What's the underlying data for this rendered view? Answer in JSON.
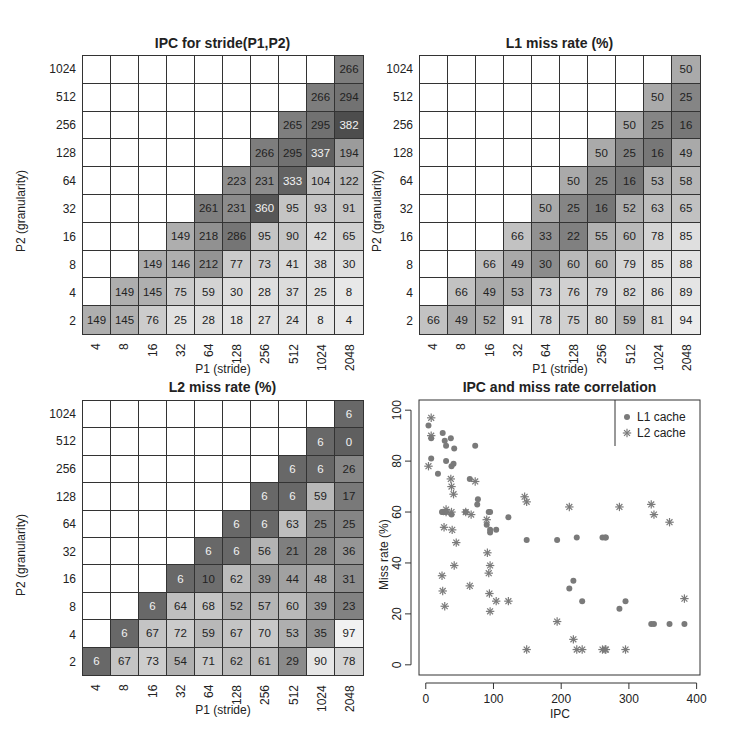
{
  "chart_data": [
    {
      "type": "heatmap",
      "title": "IPC for stride(P1,P2)",
      "xlabel": "P1 (stride)",
      "ylabel": "P2 (granularity)",
      "x_categories": [
        "4",
        "8",
        "16",
        "32",
        "64",
        "128",
        "256",
        "512",
        "1024",
        "2048"
      ],
      "y_categories": [
        "2",
        "4",
        "8",
        "16",
        "32",
        "64",
        "128",
        "256",
        "512",
        "1024"
      ],
      "values_by_row_top_to_bottom": {
        "1024": [
          null,
          null,
          null,
          null,
          null,
          null,
          null,
          null,
          null,
          266
        ],
        "512": [
          null,
          null,
          null,
          null,
          null,
          null,
          null,
          null,
          266,
          294
        ],
        "256": [
          null,
          null,
          null,
          null,
          null,
          null,
          null,
          265,
          295,
          382
        ],
        "128": [
          null,
          null,
          null,
          null,
          null,
          null,
          266,
          295,
          337,
          194
        ],
        "64": [
          null,
          null,
          null,
          null,
          null,
          223,
          231,
          333,
          104,
          122
        ],
        "32": [
          null,
          null,
          null,
          null,
          261,
          231,
          360,
          95,
          93,
          91
        ],
        "16": [
          null,
          null,
          null,
          149,
          218,
          286,
          95,
          90,
          42,
          65
        ],
        "8": [
          null,
          null,
          149,
          146,
          212,
          77,
          73,
          41,
          38,
          30
        ],
        "4": [
          null,
          149,
          145,
          75,
          59,
          30,
          28,
          37,
          25,
          8
        ],
        "2": [
          149,
          145,
          76,
          25,
          28,
          18,
          27,
          24,
          8,
          4
        ]
      },
      "range": [
        0,
        400
      ],
      "color_scale": "grayscale, darker = higher"
    },
    {
      "type": "heatmap",
      "title": "L1 miss rate (%)",
      "xlabel": "P1 (stride)",
      "ylabel": "P2 (granularity)",
      "x_categories": [
        "4",
        "8",
        "16",
        "32",
        "64",
        "128",
        "256",
        "512",
        "1024",
        "2048"
      ],
      "y_categories": [
        "2",
        "4",
        "8",
        "16",
        "32",
        "64",
        "128",
        "256",
        "512",
        "1024"
      ],
      "values_by_row_top_to_bottom": {
        "1024": [
          null,
          null,
          null,
          null,
          null,
          null,
          null,
          null,
          null,
          50
        ],
        "512": [
          null,
          null,
          null,
          null,
          null,
          null,
          null,
          null,
          50,
          25
        ],
        "256": [
          null,
          null,
          null,
          null,
          null,
          null,
          null,
          50,
          25,
          16
        ],
        "128": [
          null,
          null,
          null,
          null,
          null,
          null,
          50,
          25,
          16,
          49
        ],
        "64": [
          null,
          null,
          null,
          null,
          null,
          50,
          25,
          16,
          53,
          58
        ],
        "32": [
          null,
          null,
          null,
          null,
          50,
          25,
          16,
          52,
          63,
          65
        ],
        "16": [
          null,
          null,
          null,
          66,
          33,
          22,
          55,
          60,
          78,
          85
        ],
        "8": [
          null,
          null,
          66,
          49,
          30,
          60,
          60,
          79,
          85,
          88
        ],
        "4": [
          null,
          66,
          49,
          53,
          73,
          76,
          79,
          82,
          86,
          89
        ],
        "2": [
          66,
          49,
          52,
          91,
          78,
          75,
          80,
          59,
          81,
          94
        ]
      },
      "range": [
        0,
        100
      ],
      "color_scale": "grayscale, darker = lower"
    },
    {
      "type": "heatmap",
      "title": "L2 miss rate (%)",
      "xlabel": "P1 (stride)",
      "ylabel": "P2 (granularity)",
      "x_categories": [
        "4",
        "8",
        "16",
        "32",
        "64",
        "128",
        "256",
        "512",
        "1024",
        "2048"
      ],
      "y_categories": [
        "2",
        "4",
        "8",
        "16",
        "32",
        "64",
        "128",
        "256",
        "512",
        "1024"
      ],
      "values_by_row_top_to_bottom": {
        "1024": [
          null,
          null,
          null,
          null,
          null,
          null,
          null,
          null,
          null,
          6
        ],
        "512": [
          null,
          null,
          null,
          null,
          null,
          null,
          null,
          null,
          6,
          0
        ],
        "256": [
          null,
          null,
          null,
          null,
          null,
          null,
          null,
          6,
          6,
          26
        ],
        "128": [
          null,
          null,
          null,
          null,
          null,
          null,
          6,
          6,
          59,
          17
        ],
        "64": [
          null,
          null,
          null,
          null,
          null,
          6,
          6,
          63,
          25,
          25
        ],
        "32": [
          null,
          null,
          null,
          null,
          6,
          6,
          56,
          21,
          28,
          36
        ],
        "16": [
          null,
          null,
          null,
          6,
          10,
          62,
          39,
          44,
          48,
          31
        ],
        "8": [
          null,
          null,
          6,
          64,
          68,
          52,
          57,
          60,
          39,
          23
        ],
        "4": [
          null,
          6,
          67,
          72,
          59,
          67,
          70,
          53,
          35,
          97
        ],
        "2": [
          6,
          67,
          73,
          54,
          71,
          62,
          61,
          29,
          90,
          78
        ]
      },
      "range": [
        0,
        100
      ],
      "color_scale": "grayscale, darker = lower"
    },
    {
      "type": "scatter",
      "title": "IPC and miss rate correlation",
      "xlabel": "IPC",
      "ylabel": "Miss rate (%)",
      "xlim": [
        -10,
        405
      ],
      "ylim": [
        -4,
        104
      ],
      "xticks": [
        0,
        100,
        200,
        300,
        400
      ],
      "yticks": [
        0,
        20,
        40,
        60,
        80,
        100
      ],
      "legend": {
        "position": "top-right",
        "entries": [
          "L1 cache",
          "L2 cache"
        ]
      },
      "series": [
        {
          "name": "L1 cache",
          "marker": "dot",
          "points": [
            [
              4,
              94
            ],
            [
              8,
              81
            ],
            [
              8,
              89
            ],
            [
              25,
              91
            ],
            [
              28,
              88
            ],
            [
              30,
              86
            ],
            [
              37,
              89
            ],
            [
              42,
              85
            ],
            [
              30,
              80
            ],
            [
              38,
              78
            ],
            [
              41,
              79
            ],
            [
              18,
              75
            ],
            [
              24,
              60
            ],
            [
              25,
              60
            ],
            [
              28,
              60
            ],
            [
              30,
              60
            ],
            [
              38,
              59
            ],
            [
              65,
              73
            ],
            [
              73,
              86
            ],
            [
              59,
              60
            ],
            [
              76,
              63
            ],
            [
              77,
              65
            ],
            [
              90,
              55
            ],
            [
              93,
              60
            ],
            [
              95,
              52
            ],
            [
              95,
              53
            ],
            [
              95,
              60
            ],
            [
              104,
              53
            ],
            [
              122,
              58
            ],
            [
              149,
              49
            ],
            [
              194,
              49
            ],
            [
              212,
              30
            ],
            [
              218,
              33
            ],
            [
              223,
              50
            ],
            [
              231,
              25
            ],
            [
              261,
              50
            ],
            [
              266,
              50
            ],
            [
              265,
              50
            ],
            [
              286,
              22
            ],
            [
              295,
              25
            ],
            [
              333,
              16
            ],
            [
              337,
              16
            ],
            [
              360,
              16
            ],
            [
              382,
              16
            ]
          ]
        },
        {
          "name": "L2 cache",
          "marker": "star",
          "points": [
            [
              4,
              78
            ],
            [
              8,
              97
            ],
            [
              8,
              90
            ],
            [
              24,
              35
            ],
            [
              25,
              29
            ],
            [
              28,
              23
            ],
            [
              30,
              61
            ],
            [
              37,
              73
            ],
            [
              38,
              70
            ],
            [
              41,
              67
            ],
            [
              27,
              54
            ],
            [
              30,
              60
            ],
            [
              38,
              60
            ],
            [
              39,
              53
            ],
            [
              42,
              39
            ],
            [
              45,
              48
            ],
            [
              59,
              60
            ],
            [
              65,
              31
            ],
            [
              67,
              59
            ],
            [
              73,
              72
            ],
            [
              90,
              57
            ],
            [
              91,
              44
            ],
            [
              93,
              36
            ],
            [
              94,
              28
            ],
            [
              95,
              21
            ],
            [
              95,
              39
            ],
            [
              104,
              25
            ],
            [
              122,
              25
            ],
            [
              146,
              66
            ],
            [
              149,
              6
            ],
            [
              149,
              64
            ],
            [
              194,
              17
            ],
            [
              212,
              62
            ],
            [
              218,
              10
            ],
            [
              223,
              6
            ],
            [
              231,
              6
            ],
            [
              261,
              6
            ],
            [
              265,
              6
            ],
            [
              266,
              6
            ],
            [
              295,
              6
            ],
            [
              286,
              62
            ],
            [
              333,
              63
            ],
            [
              337,
              59
            ],
            [
              360,
              56
            ],
            [
              382,
              26
            ]
          ]
        }
      ]
    }
  ],
  "panels": {
    "ipc": {
      "title": "IPC for stride(P1,P2)"
    },
    "l1": {
      "title": "L1 miss rate (%)"
    },
    "l2": {
      "title": "L2 miss rate (%)"
    },
    "scatter": {
      "title": "IPC and miss rate correlation",
      "xlabel": "IPC",
      "ylabel": "Miss rate (%)",
      "legend_l1": "L1 cache",
      "legend_l2": "L2 cache"
    }
  },
  "axes": {
    "xlabel": "P1 (stride)",
    "ylabel": "P2 (granularity)"
  }
}
